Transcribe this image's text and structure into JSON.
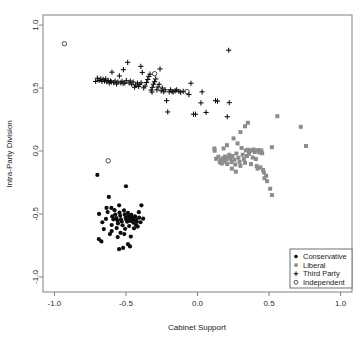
{
  "chart_data": {
    "type": "scatter",
    "title": "",
    "xlabel": "Cabinet Support",
    "ylabel": "Intra-Party Division",
    "xlim": [
      -1.08,
      1.08
    ],
    "ylim": [
      -1.12,
      1.08
    ],
    "xticks": [
      -1.0,
      -0.5,
      0.0,
      0.5,
      1.0
    ],
    "yticks": [
      -1.0,
      -0.5,
      0.0,
      0.5,
      1.0
    ],
    "xtick_labels": [
      "-1.0",
      "-0.5",
      "0.0",
      "0.5",
      "1.0"
    ],
    "ytick_labels": [
      "-1.0",
      "-0.5",
      "0.0",
      "0.5",
      "1.0"
    ],
    "grid": false,
    "legend_position": "bottom-right",
    "series": [
      {
        "name": "Conservative",
        "marker": "filled-circle",
        "color": "#0d0d0d",
        "points": [
          [
            -0.7,
            -0.19
          ],
          [
            -0.628,
            -0.485
          ],
          [
            -0.688,
            -0.5
          ],
          [
            -0.64,
            -0.54
          ],
          [
            -0.665,
            -0.566
          ],
          [
            -0.655,
            -0.62
          ],
          [
            -0.69,
            -0.7
          ],
          [
            -0.672,
            -0.718
          ],
          [
            -0.62,
            -0.365
          ],
          [
            -0.602,
            -0.452
          ],
          [
            -0.596,
            -0.52
          ],
          [
            -0.588,
            -0.543
          ],
          [
            -0.6,
            -0.588
          ],
          [
            -0.612,
            -0.66
          ],
          [
            -0.58,
            -0.47
          ],
          [
            -0.575,
            -0.505
          ],
          [
            -0.568,
            -0.533
          ],
          [
            -0.56,
            -0.551
          ],
          [
            -0.556,
            -0.575
          ],
          [
            -0.565,
            -0.612
          ],
          [
            -0.548,
            -0.432
          ],
          [
            -0.545,
            -0.49
          ],
          [
            -0.54,
            -0.515
          ],
          [
            -0.535,
            -0.545
          ],
          [
            -0.53,
            -0.56
          ],
          [
            -0.524,
            -0.59
          ],
          [
            -0.538,
            -0.65
          ],
          [
            -0.548,
            -0.78
          ],
          [
            -0.52,
            -0.77
          ],
          [
            -0.514,
            -0.472
          ],
          [
            -0.508,
            -0.504
          ],
          [
            -0.502,
            -0.528
          ],
          [
            -0.498,
            -0.545
          ],
          [
            -0.492,
            -0.562
          ],
          [
            -0.506,
            -0.618
          ],
          [
            -0.486,
            -0.492
          ],
          [
            -0.48,
            -0.516
          ],
          [
            -0.474,
            -0.538
          ],
          [
            -0.47,
            -0.556
          ],
          [
            -0.478,
            -0.596
          ],
          [
            -0.462,
            -0.508
          ],
          [
            -0.456,
            -0.53
          ],
          [
            -0.452,
            -0.548
          ],
          [
            -0.448,
            -0.57
          ],
          [
            -0.444,
            -0.614
          ],
          [
            -0.5,
            -0.28
          ],
          [
            -0.436,
            -0.52
          ],
          [
            -0.43,
            -0.544
          ],
          [
            -0.424,
            -0.562
          ],
          [
            -0.418,
            -0.6
          ],
          [
            -0.408,
            -0.53
          ],
          [
            -0.398,
            -0.566
          ],
          [
            -0.392,
            -0.432
          ],
          [
            -0.38,
            -0.538
          ],
          [
            -0.486,
            -0.74
          ],
          [
            -0.472,
            -0.758
          ],
          [
            -0.6,
            -0.636
          ],
          [
            -0.636,
            -0.452
          ],
          [
            -0.558,
            -0.684
          ],
          [
            -0.512,
            -0.66
          ],
          [
            -0.466,
            -0.68
          ],
          [
            -0.43,
            -0.588
          ],
          [
            -0.41,
            -0.486
          ]
        ]
      },
      {
        "name": "Liberal",
        "marker": "filled-square",
        "color": "#8c8c8c",
        "points": [
          [
            0.118,
            0.02
          ],
          [
            0.13,
            -0.062
          ],
          [
            0.146,
            -0.046
          ],
          [
            0.156,
            -0.09
          ],
          [
            0.162,
            -0.072
          ],
          [
            0.17,
            -0.1
          ],
          [
            0.178,
            -0.058
          ],
          [
            0.186,
            -0.086
          ],
          [
            0.192,
            -0.044
          ],
          [
            0.2,
            -0.07
          ],
          [
            0.208,
            -0.104
          ],
          [
            0.214,
            -0.05
          ],
          [
            0.222,
            -0.03
          ],
          [
            0.23,
            -0.062
          ],
          [
            0.238,
            -0.088
          ],
          [
            0.244,
            -0.04
          ],
          [
            0.252,
            0.1
          ],
          [
            0.258,
            -0.07
          ],
          [
            0.264,
            -0.108
          ],
          [
            0.272,
            -0.02
          ],
          [
            0.28,
            0.06
          ],
          [
            0.286,
            -0.054
          ],
          [
            0.294,
            -0.086
          ],
          [
            0.3,
            -0.118
          ],
          [
            0.308,
            0.024
          ],
          [
            0.316,
            -0.03
          ],
          [
            0.324,
            -0.064
          ],
          [
            0.332,
            -0.094
          ],
          [
            0.338,
            0.004
          ],
          [
            0.346,
            -0.04
          ],
          [
            0.352,
            0.01
          ],
          [
            0.36,
            -0.022
          ],
          [
            0.366,
            0.0
          ],
          [
            0.374,
            -0.104
          ],
          [
            0.38,
            0.006
          ],
          [
            0.386,
            -0.052
          ],
          [
            0.392,
            0.012
          ],
          [
            0.4,
            -0.008
          ],
          [
            0.406,
            0.002
          ],
          [
            0.414,
            -0.12
          ],
          [
            0.42,
            -0.14
          ],
          [
            0.426,
            0.008
          ],
          [
            0.432,
            -0.012
          ],
          [
            0.44,
            -0.13
          ],
          [
            0.446,
            0.004
          ],
          [
            0.452,
            -0.018
          ],
          [
            0.458,
            -0.15
          ],
          [
            0.464,
            -0.17
          ],
          [
            0.3,
            0.15
          ],
          [
            0.332,
            0.196
          ],
          [
            0.352,
            0.224
          ],
          [
            0.206,
            0.046
          ],
          [
            0.182,
            0.02
          ],
          [
            0.48,
            -0.196
          ],
          [
            0.468,
            -0.216
          ],
          [
            0.486,
            -0.24
          ],
          [
            0.508,
            -0.3
          ],
          [
            0.52,
            -0.35
          ],
          [
            0.52,
            0.03
          ],
          [
            0.558,
            0.276
          ],
          [
            0.722,
            0.192
          ],
          [
            0.758,
            0.04
          ],
          [
            0.24,
            -0.14
          ],
          [
            0.268,
            -0.164
          ],
          [
            0.408,
            -0.064
          ],
          [
            0.12,
            0.002
          ]
        ]
      },
      {
        "name": "Third Party",
        "marker": "plus",
        "color": "#0d0d0d",
        "points": [
          [
            -0.712,
            0.552
          ],
          [
            -0.7,
            0.578
          ],
          [
            -0.688,
            0.56
          ],
          [
            -0.676,
            0.572
          ],
          [
            -0.668,
            0.552
          ],
          [
            -0.66,
            0.568
          ],
          [
            -0.65,
            0.556
          ],
          [
            -0.642,
            0.572
          ],
          [
            -0.634,
            0.548
          ],
          [
            -0.624,
            0.56
          ],
          [
            -0.616,
            0.54
          ],
          [
            -0.608,
            0.556
          ],
          [
            -0.598,
            0.626
          ],
          [
            -0.586,
            0.542
          ],
          [
            -0.576,
            0.556
          ],
          [
            -0.566,
            0.532
          ],
          [
            -0.556,
            0.548
          ],
          [
            -0.546,
            0.596
          ],
          [
            -0.536,
            0.54
          ],
          [
            -0.528,
            0.554
          ],
          [
            -0.518,
            0.646
          ],
          [
            -0.508,
            0.54
          ],
          [
            -0.498,
            0.558
          ],
          [
            -0.488,
            0.704
          ],
          [
            -0.478,
            0.54
          ],
          [
            -0.47,
            0.556
          ],
          [
            -0.46,
            0.53
          ],
          [
            -0.45,
            0.548
          ],
          [
            -0.44,
            0.506
          ],
          [
            -0.432,
            0.524
          ],
          [
            -0.42,
            0.54
          ],
          [
            -0.412,
            0.512
          ],
          [
            -0.404,
            0.53
          ],
          [
            -0.396,
            0.672
          ],
          [
            -0.386,
            0.624
          ],
          [
            -0.376,
            0.502
          ],
          [
            -0.366,
            0.516
          ],
          [
            -0.356,
            0.544
          ],
          [
            -0.348,
            0.568
          ],
          [
            -0.34,
            0.592
          ],
          [
            -0.332,
            0.61
          ],
          [
            -0.324,
            0.484
          ],
          [
            -0.316,
            0.506
          ],
          [
            -0.308,
            0.53
          ],
          [
            -0.3,
            0.55
          ],
          [
            -0.292,
            0.572
          ],
          [
            -0.284,
            0.486
          ],
          [
            -0.276,
            0.508
          ],
          [
            -0.268,
            0.53
          ],
          [
            -0.262,
            0.652
          ],
          [
            -0.254,
            0.478
          ],
          [
            -0.246,
            0.5
          ],
          [
            -0.236,
            0.47
          ],
          [
            -0.226,
            0.486
          ],
          [
            -0.216,
            0.4
          ],
          [
            -0.208,
            0.31
          ],
          [
            -0.198,
            0.47
          ],
          [
            -0.188,
            0.486
          ],
          [
            -0.178,
            0.472
          ],
          [
            -0.17,
            0.47
          ],
          [
            -0.156,
            0.478
          ],
          [
            -0.146,
            0.486
          ],
          [
            -0.13,
            0.474
          ],
          [
            -0.118,
            0.468
          ],
          [
            -0.1,
            0.474
          ],
          [
            -0.06,
            0.448
          ],
          [
            -0.046,
            0.538
          ],
          [
            -0.028,
            0.292
          ],
          [
            -0.014,
            0.292
          ],
          [
            0.024,
            0.382
          ],
          [
            0.032,
            0.47
          ],
          [
            0.06,
            0.306
          ],
          [
            0.126,
            0.4
          ],
          [
            0.14,
            0.396
          ],
          [
            0.208,
            0.272
          ],
          [
            0.222,
            0.384
          ],
          [
            0.218,
            0.8
          ],
          [
            -0.318,
            0.468
          ],
          [
            -0.394,
            0.542
          ],
          [
            -0.52,
            0.536
          ],
          [
            -0.602,
            0.548
          ]
        ]
      },
      {
        "name": "Independent",
        "marker": "open-circle",
        "color": "#3a3a3a",
        "points": [
          [
            -0.624,
            -0.078
          ],
          [
            -0.074,
            0.472
          ],
          [
            -0.3,
            0.614
          ],
          [
            -0.93,
            0.852
          ]
        ]
      }
    ]
  },
  "legend": {
    "entries": [
      {
        "label": "Conservative",
        "marker": "filled-circle"
      },
      {
        "label": "Liberal",
        "marker": "filled-square"
      },
      {
        "label": "Third Party",
        "marker": "plus"
      },
      {
        "label": "Independent",
        "marker": "open-circle"
      }
    ]
  },
  "colors": {
    "conservative": "#0d0d0d",
    "liberal": "#8c8c8c",
    "thirdparty": "#0d0d0d",
    "independent": "#3a3a3a",
    "axis": "#808080",
    "background": "#ffffff"
  }
}
